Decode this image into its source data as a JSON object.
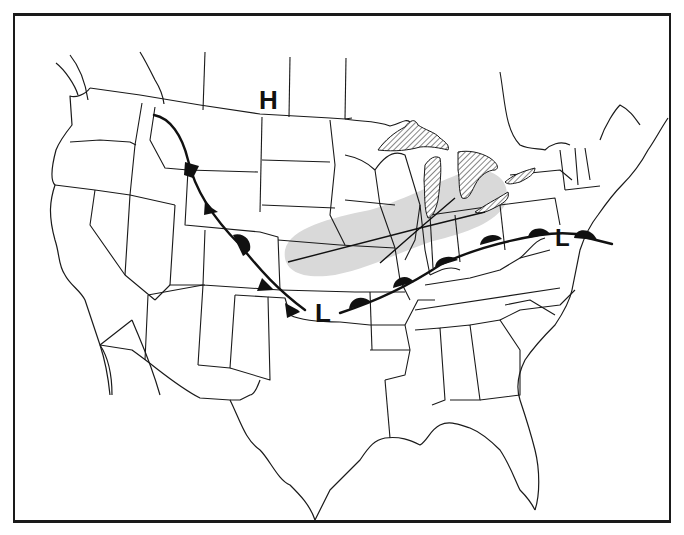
{
  "map": {
    "title": "",
    "type": "surface weather map",
    "region": "Continental United States",
    "colors": {
      "frame": "#1a1a1a",
      "lines": "#1a1a1a",
      "precip_band": "#d9d9d9",
      "lake_hatch": "#555555",
      "fronts": "#111111"
    },
    "pressure_centers": [
      {
        "label": "H",
        "meaning": "high pressure",
        "location": "Montana / North Dakota border area",
        "x": 263,
        "y": 88
      },
      {
        "label": "L",
        "meaning": "low pressure",
        "location": "Oklahoma / Kansas area",
        "x": 315,
        "y": 303
      },
      {
        "label": "L",
        "meaning": "low pressure",
        "location": "Maryland / Delaware coast",
        "x": 555,
        "y": 227
      }
    ],
    "fronts": [
      {
        "type": "cold front",
        "symbol": "triangles",
        "count": 4,
        "path": "Idaho/Montana -> Wyoming -> Colorado -> Oklahoma"
      },
      {
        "type": "stationary/warm segment",
        "symbol": "semicircle",
        "count": 1,
        "path": "Colorado"
      },
      {
        "type": "warm front",
        "symbol": "semicircles",
        "count": 6,
        "path": "Oklahoma -> Arkansas -> Tennessee/Kentucky -> Virginia -> Maryland -> Atlantic"
      }
    ],
    "precipitation_band": {
      "shade": "light gray",
      "extent": "Kansas/Nebraska -> Iowa -> Illinois -> Indiana -> Ohio -> Lake Erie"
    },
    "troughs": [
      {
        "description": "line from Kansas to Lake Erie"
      },
      {
        "description": "line from Missouri to Lake Michigan"
      }
    ],
    "hatched_features": [
      "Lake Superior",
      "Lake Michigan",
      "Lake Huron",
      "Lake Erie",
      "Lake Ontario"
    ]
  }
}
